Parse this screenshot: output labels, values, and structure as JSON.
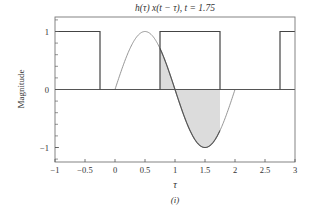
{
  "chart_data": {
    "type": "line",
    "title": "h(τ) x(t − τ), t = 1.75",
    "xlabel": "τ",
    "ylabel": "Magnitude",
    "caption": "(i)",
    "xlim": [
      -1,
      3
    ],
    "ylim": [
      -1.25,
      1.25
    ],
    "xticks": [
      -1,
      -0.5,
      0,
      0.5,
      1,
      1.5,
      2,
      2.5,
      3
    ],
    "xtick_labels": [
      "−1",
      "−0.5",
      "0",
      "0.5",
      "1",
      "1.5",
      "2",
      "2.5",
      "3"
    ],
    "yticks": [
      -1,
      0,
      1
    ],
    "ytick_labels": [
      "−1",
      "0",
      "1"
    ],
    "y_minor_step": 0.2,
    "t": 1.75,
    "series": [
      {
        "name": "h(τ)",
        "description": "sin(πτ) for 0 ≤ τ ≤ 2, else 0",
        "support": [
          0,
          2
        ],
        "color": "#8a8a8a"
      },
      {
        "name": "x(t − τ)",
        "description": "rectangular pulses of height 1",
        "pulses": [
          [
            -1,
            -0.25
          ],
          [
            0.75,
            1.75
          ],
          [
            2.75,
            3
          ]
        ],
        "height": 1,
        "color": "#444444"
      },
      {
        "name": "h(τ) x(t − τ)",
        "description": "shaded product region",
        "support": [
          0.75,
          1.75
        ],
        "fill": "#dcdcdc",
        "color": "#555555"
      }
    ],
    "grid": false,
    "legend": "none"
  }
}
